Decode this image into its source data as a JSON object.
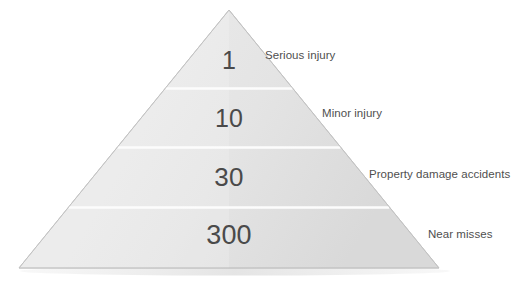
{
  "diagram": {
    "type": "safety-accident-pyramid",
    "title": "",
    "colors": {
      "background": "#ffffff",
      "pyramid_fill_light": "#e8e8e8",
      "pyramid_fill_dark": "#dcdcdc",
      "pyramid_edge": "#c9c9c9",
      "divider": "#fbfbfb",
      "number_text": "#4a4a4a",
      "label_text": "#4f4f4f"
    },
    "geometry": {
      "apex_x": 229,
      "apex_y": 10,
      "base_left_x": 19,
      "base_right_x": 439,
      "base_y": 268,
      "divider_y": [
        88,
        147,
        207
      ]
    },
    "tiers": [
      {
        "value": "1",
        "label": "Serious injury"
      },
      {
        "value": "10",
        "label": "Minor injury"
      },
      {
        "value": "30",
        "label": "Property damage accidents"
      },
      {
        "value": "300",
        "label": "Near misses"
      }
    ]
  }
}
